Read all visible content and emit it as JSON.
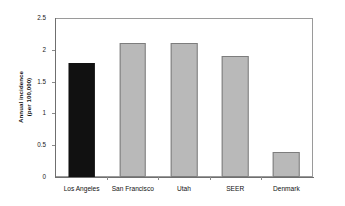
{
  "chart_data": {
    "type": "bar",
    "title": "",
    "xlabel": "",
    "ylabel_line1": "Annual incidence",
    "ylabel_line2": "(per 100,000)",
    "categories": [
      "Los Angeles",
      "San Francisco",
      "Utah",
      "SEER",
      "Denmark"
    ],
    "values": [
      1.8,
      2.1,
      2.1,
      1.9,
      0.4
    ],
    "series": [
      {
        "name": "Annual incidence (per 100,000)",
        "values": [
          1.8,
          2.1,
          2.1,
          1.9,
          0.4
        ]
      }
    ],
    "ylim": [
      0,
      2.5
    ],
    "yticks": [
      0,
      0.5,
      1,
      1.5,
      2,
      2.5
    ],
    "ytick_labels": [
      "0",
      "0.5",
      "1",
      "1.5",
      "2",
      "2.5"
    ],
    "grid": false,
    "legend": "none",
    "bar_colors": [
      "#111111",
      "#b9b9b9",
      "#b9b9b9",
      "#b9b9b9",
      "#b9b9b9"
    ],
    "bar_border_color": "#7d7d7d",
    "highlight_category": "Los Angeles",
    "frame_color": "#9a9a9a",
    "axis_color": "#6f6f6f",
    "text_color": "#111111"
  }
}
